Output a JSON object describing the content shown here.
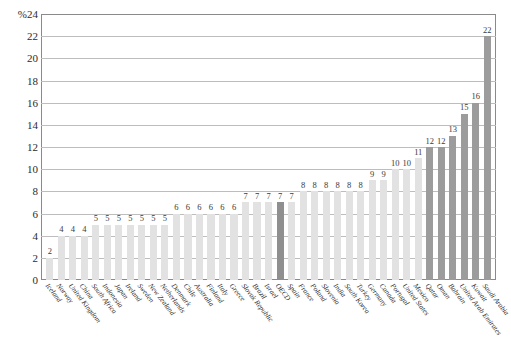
{
  "chart_data": {
    "type": "bar",
    "title": "",
    "subtitle": "",
    "xlabel": "",
    "ylabel": "",
    "unit_label": "%",
    "ylim": [
      0,
      24
    ],
    "ytick_step": 2,
    "yticks": [
      "%24",
      "22",
      "20",
      "18",
      "16",
      "14",
      "12",
      "10",
      "8",
      "6",
      "4",
      "2",
      "0"
    ],
    "ytick_values": [
      24,
      22,
      20,
      18,
      16,
      14,
      12,
      10,
      8,
      6,
      4,
      2,
      0
    ],
    "grid": true,
    "legend_position": "none",
    "categories": [
      "Iceland",
      "Norway",
      "United Kingdom",
      "China",
      "South Africa",
      "Indonesia",
      "Japan",
      "Ireland",
      "Sweden",
      "New Zealand",
      "Netherlands",
      "Denmark",
      "Chile",
      "Australia",
      "Finland",
      "Italy",
      "Greece",
      "Slovak Republic",
      "Brazil",
      "Israel",
      "OECD",
      "Spain",
      "France",
      "Poland",
      "Slovenia",
      "India",
      "South Korea",
      "Turkey",
      "Germany",
      "Canada",
      "Portugal",
      "United States",
      "Mexico",
      "Qatar",
      "Oman",
      "Bahrain",
      "United Arab Emirates",
      "Kuwait",
      "Saudi Arabia"
    ],
    "values": [
      2,
      4,
      4,
      4,
      5,
      5,
      5,
      5,
      5,
      5,
      5,
      6,
      6,
      6,
      6,
      6,
      6,
      7,
      7,
      7,
      7,
      7,
      8,
      8,
      8,
      8,
      8,
      8,
      9,
      9,
      10,
      10,
      11,
      12,
      12,
      13,
      15,
      16,
      22
    ],
    "bar_styles": [
      "normal",
      "normal",
      "normal",
      "normal",
      "normal",
      "normal",
      "normal",
      "normal",
      "normal",
      "normal",
      "normal",
      "normal",
      "normal",
      "normal",
      "normal",
      "normal",
      "normal",
      "normal",
      "normal",
      "normal",
      "oecd",
      "normal",
      "normal",
      "normal",
      "normal",
      "normal",
      "normal",
      "normal",
      "normal",
      "normal",
      "normal",
      "normal",
      "normal",
      "gulf",
      "gulf",
      "gulf",
      "gulf",
      "gulf",
      "gulf"
    ],
    "colors": {
      "bar_normal": "#e2e2e2",
      "bar_oecd": "#8f8f8f",
      "bar_gulf": "#9c9c9c",
      "gridline": "#bdbdbd",
      "axis": "#8a8a8a",
      "text": "#2b2b2b",
      "background": "#ffffff"
    }
  }
}
